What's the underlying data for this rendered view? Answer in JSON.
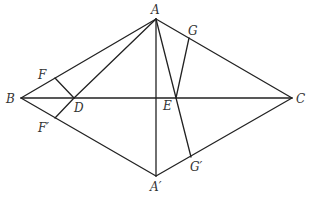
{
  "diagram": {
    "title": "",
    "points": [
      {
        "id": "A",
        "label": "A",
        "x": 156,
        "y": 19,
        "lx": 151,
        "ly": 14
      },
      {
        "id": "B",
        "label": "B",
        "x": 21,
        "y": 98,
        "lx": 6,
        "ly": 103
      },
      {
        "id": "C",
        "label": "C",
        "x": 292,
        "y": 98,
        "lx": 296,
        "ly": 103
      },
      {
        "id": "A2",
        "label": "A′",
        "x": 156,
        "y": 176,
        "lx": 150,
        "ly": 191
      },
      {
        "id": "D",
        "label": "D",
        "x": 74,
        "y": 98,
        "lx": 74,
        "ly": 112
      },
      {
        "id": "E",
        "label": "E",
        "x": 176,
        "y": 98,
        "lx": 163,
        "ly": 110
      },
      {
        "id": "F",
        "label": "F",
        "x": 55,
        "y": 78,
        "lx": 38,
        "ly": 79
      },
      {
        "id": "F2",
        "label": "F′",
        "x": 55,
        "y": 118,
        "lx": 38,
        "ly": 132
      },
      {
        "id": "G",
        "label": "G",
        "x": 189,
        "y": 38,
        "lx": 188,
        "ly": 35
      },
      {
        "id": "G2",
        "label": "G′",
        "x": 191,
        "y": 157,
        "lx": 190,
        "ly": 171
      }
    ],
    "segments": [
      [
        "A",
        "B"
      ],
      [
        "A",
        "C"
      ],
      [
        "A2",
        "B"
      ],
      [
        "A2",
        "C"
      ],
      [
        "B",
        "C"
      ],
      [
        "A",
        "A2"
      ],
      [
        "A",
        "D"
      ],
      [
        "F",
        "D"
      ],
      [
        "F2",
        "D"
      ],
      [
        "A",
        "G2"
      ],
      [
        "G",
        "E"
      ]
    ],
    "colors": {
      "line": "#222222",
      "label": "#333333",
      "background": "#ffffff"
    }
  }
}
